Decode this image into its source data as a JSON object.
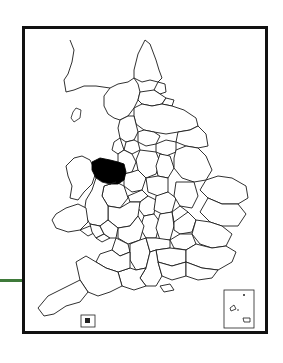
{
  "map": {
    "type": "locator-map",
    "region": "England and Wales",
    "subdivisions": "counties",
    "highlighted_area": {
      "name": "Clwyd",
      "fill": "#000000"
    },
    "frame_color": "#111111",
    "connector_color": "#3f7a3a",
    "insets": [
      {
        "name": "isles-of-scilly-inset",
        "position": "bottom-right"
      },
      {
        "name": "channel-inset",
        "position": "bottom-left"
      }
    ]
  }
}
